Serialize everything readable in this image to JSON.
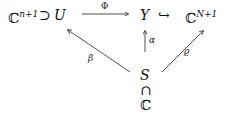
{
  "diagram": {
    "nodes": {
      "cn1": {
        "base": "ℂ",
        "sup": "n+1"
      },
      "supset": "⊃",
      "U": "U",
      "Y": "Y",
      "hook": "↪",
      "cN1": {
        "base": "ℂ",
        "sup": "N+1"
      },
      "S": "S",
      "cap": "∩",
      "C": "ℂ"
    },
    "edges": {
      "phi": "Φ",
      "alpha": "α",
      "beta": "β",
      "rho": "ϱ"
    }
  }
}
